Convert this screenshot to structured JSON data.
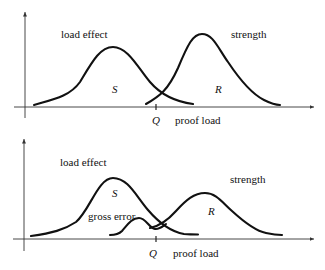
{
  "figure": {
    "panels": [
      {
        "id": "top",
        "labels": {
          "load_effect": "load effect",
          "strength": "strength",
          "S": "S",
          "R": "R",
          "Q": "Q",
          "proof_load": "proof load"
        }
      },
      {
        "id": "bottom",
        "labels": {
          "load_effect": "load effect",
          "strength": "strength",
          "S": "S",
          "R": "R",
          "gross_error": "gross error",
          "Q": "Q",
          "proof_load": "proof load"
        }
      }
    ]
  },
  "colors": {
    "background": "#ffffff",
    "curve": "#111111",
    "axis": "#333333"
  }
}
